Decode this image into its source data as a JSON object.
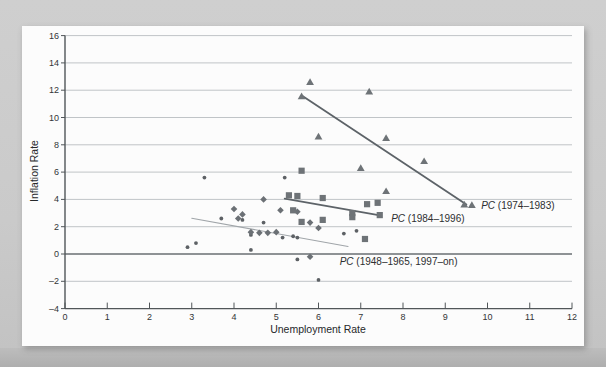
{
  "chart_data": {
    "type": "scatter",
    "title": "",
    "xlabel": "Unemployment Rate",
    "ylabel": "Inflation Rate",
    "xlim": [
      0,
      12
    ],
    "ylim": [
      -4,
      16
    ],
    "x_ticks": [
      0,
      1,
      2,
      3,
      4,
      5,
      6,
      7,
      8,
      9,
      10,
      11,
      12
    ],
    "y_ticks": [
      -4,
      -2,
      0,
      2,
      4,
      6,
      8,
      10,
      12,
      14,
      16
    ],
    "grid": "horizontal",
    "legend": "none",
    "series": [
      {
        "name": "PC (1948-1965) observations",
        "marker": "circle",
        "color": "#5d6165",
        "points": [
          [
            3.3,
            5.6
          ],
          [
            5.2,
            5.6
          ],
          [
            2.9,
            0.5
          ],
          [
            3.1,
            0.8
          ],
          [
            3.7,
            2.6
          ],
          [
            4.2,
            2.5
          ],
          [
            4.7,
            2.3
          ],
          [
            4.4,
            0.3
          ],
          [
            4.4,
            1.4
          ],
          [
            5.15,
            1.2
          ],
          [
            5.4,
            1.3
          ],
          [
            5.5,
            1.2
          ],
          [
            6.6,
            1.5
          ],
          [
            6.9,
            1.7
          ],
          [
            5.5,
            -0.4
          ],
          [
            6.0,
            -1.9
          ]
        ]
      },
      {
        "name": "PC (1997-on) observations",
        "marker": "diamond",
        "color": "#6b7075",
        "points": [
          [
            4.0,
            3.3
          ],
          [
            4.2,
            2.9
          ],
          [
            4.1,
            2.6
          ],
          [
            4.7,
            4.0
          ],
          [
            5.1,
            3.2
          ],
          [
            5.5,
            3.1
          ],
          [
            5.8,
            2.3
          ],
          [
            6.0,
            1.9
          ],
          [
            4.4,
            1.6
          ],
          [
            4.6,
            1.55
          ],
          [
            4.8,
            1.55
          ],
          [
            5.0,
            1.6
          ],
          [
            5.8,
            -0.2
          ]
        ]
      },
      {
        "name": "PC (1984-1996) observations",
        "marker": "square",
        "color": "#6e7377",
        "points": [
          [
            5.6,
            6.1
          ],
          [
            5.3,
            4.3
          ],
          [
            5.5,
            4.25
          ],
          [
            6.1,
            4.1
          ],
          [
            5.4,
            3.2
          ],
          [
            5.6,
            2.35
          ],
          [
            6.1,
            2.5
          ],
          [
            6.8,
            3.0
          ],
          [
            6.8,
            2.7
          ],
          [
            7.15,
            3.65
          ],
          [
            7.4,
            3.75
          ],
          [
            7.45,
            2.85
          ],
          [
            7.1,
            1.1
          ]
        ]
      },
      {
        "name": "PC (1974-1983) observations",
        "marker": "triangle",
        "color": "#6e7377",
        "points": [
          [
            5.6,
            11.55
          ],
          [
            5.8,
            12.6
          ],
          [
            7.2,
            11.9
          ],
          [
            6.0,
            8.6
          ],
          [
            7.6,
            8.5
          ],
          [
            8.5,
            6.8
          ],
          [
            7.0,
            6.3
          ],
          [
            7.6,
            4.6
          ],
          [
            9.45,
            3.62
          ],
          [
            9.63,
            3.58
          ]
        ]
      }
    ],
    "trend_lines": [
      {
        "label_prefix": "PC",
        "label_text": " (1974–1983)",
        "from": [
          5.63,
          11.55
        ],
        "to": [
          9.5,
          3.62
        ],
        "color": "#5d6368",
        "width": 1.8,
        "label_anchor": [
          9.85,
          3.5
        ]
      },
      {
        "label_prefix": "PC",
        "label_text": " (1984–1996)",
        "from": [
          5.2,
          4.05
        ],
        "to": [
          7.42,
          2.85
        ],
        "color": "#5d6368",
        "width": 1.8,
        "label_anchor": [
          7.72,
          2.6
        ]
      },
      {
        "label_prefix": "PC",
        "label_text": " (1948–1965, 1997–on)",
        "from": [
          3.0,
          2.62
        ],
        "to": [
          6.7,
          0.55
        ],
        "color": "#a0a5a9",
        "width": 1.1,
        "label_anchor": [
          6.5,
          -0.55
        ]
      }
    ],
    "axis_colors": {
      "grid": "#c0c4c7",
      "zero_line": "#6a6f73",
      "axis": "#515659"
    }
  }
}
